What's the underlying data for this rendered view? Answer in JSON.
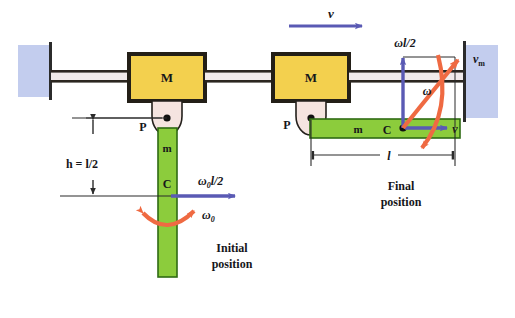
{
  "figure": {
    "colors": {
      "wall_fill": "#c3cdee",
      "wall_edge": "#2b2b2b",
      "block_fill": "#f3d04e",
      "block_edge": "#231f17",
      "rod_fill": "#f0eaea",
      "rod_edge": "#2b2620",
      "bar_fill": "#8ccc3c",
      "bar_edge": "#2f6b13",
      "pivot_fill": "#f5e4e0",
      "pivot_edge": "#24201c",
      "velocity_arrow": "#5a5ab4",
      "omega_arrow": "#ef6a42",
      "dimension_line": "#2b2b2b",
      "text": "#16161a"
    }
  },
  "initial_position": {
    "caption_line1": "Initial",
    "caption_line2": "position",
    "block_label": "M",
    "pivot_label": "P",
    "rod_mass_label": "m",
    "center_label": "C",
    "height_label": "h = l/2",
    "velocity_label": "ω0l/2",
    "velocity_label_base": "ω",
    "velocity_label_sub": "0",
    "velocity_label_rest": "l/2",
    "angular_label_base": "ω",
    "angular_label_sub": "0"
  },
  "final_position": {
    "caption_line1": "Final",
    "caption_line2": "position",
    "block_label": "M",
    "pivot_label": "P",
    "rod_mass_label": "m",
    "center_label": "C",
    "block_velocity_label": "v",
    "tangential_velocity_label": "ωl/2",
    "center_velocity_label": "v",
    "mass_velocity_label_base": "v",
    "mass_velocity_label_sub": "m",
    "angular_label": "ω",
    "length_label": "l"
  }
}
